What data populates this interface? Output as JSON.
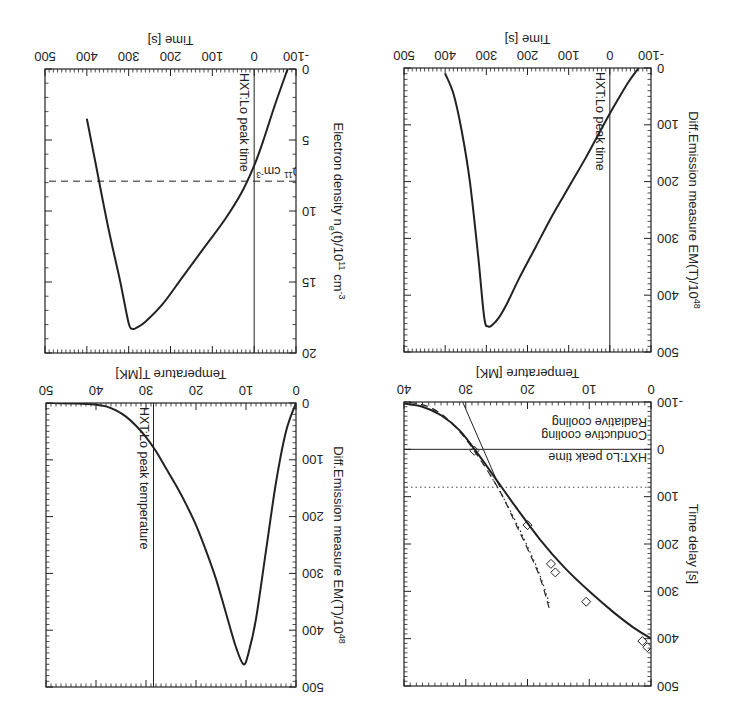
{
  "chart_data": [
    {
      "id": "panel-temperature-vs-delay",
      "type": "line",
      "position": "top-left",
      "box": [
        80,
        36,
        327,
        320
      ],
      "xlabel": "Temperature [MK]",
      "ylabel": "Time delay [s]",
      "xlim": [
        0,
        40
      ],
      "ylim": [
        -100,
        500
      ],
      "x_ticks": [
        0,
        10,
        20,
        30,
        40
      ],
      "y_ticks": [
        -100,
        0,
        100,
        200,
        300,
        400,
        500
      ],
      "hline": {
        "y": 0,
        "label": "HXT:Lo peak time"
      },
      "legend": [
        {
          "label": "Conductive cooling",
          "style": "dashed"
        },
        {
          "label": "Radiative cooling",
          "style": "dotted"
        }
      ],
      "legend_dotted_hline_y": 80,
      "series": [
        {
          "name": "Fit",
          "style": "solid-thick",
          "x": [
            0,
            3,
            6,
            10,
            14,
            18,
            22,
            25,
            28,
            31,
            34,
            37,
            40
          ],
          "y": [
            400,
            375,
            345,
            300,
            250,
            190,
            120,
            65,
            10,
            -40,
            -72,
            -90,
            -97
          ]
        },
        {
          "name": "Linear fit",
          "style": "solid-thin",
          "x": [
            24.5,
            30.5
          ],
          "y": [
            80,
            -100
          ]
        },
        {
          "name": "Conductive cooling",
          "style": "dashed",
          "x": [
            16.5,
            18,
            20,
            22,
            24,
            26,
            28,
            30,
            32,
            34,
            36,
            38,
            40
          ],
          "y": [
            335,
            270,
            210,
            155,
            100,
            55,
            15,
            -22,
            -52,
            -75,
            -90,
            -97,
            -100
          ]
        },
        {
          "name": "Radiative cooling",
          "style": "dotted",
          "x": [
            16.5,
            18,
            20,
            22,
            24,
            26
          ],
          "y": [
            325,
            265,
            205,
            150,
            100,
            55
          ]
        },
        {
          "name": "Observed",
          "style": "diamond",
          "x": [
            0.6,
            1.4,
            10.5,
            15.5,
            16.2,
            20,
            28.6
          ],
          "y": [
            418,
            405,
            322,
            260,
            242,
            160,
            3
          ]
        }
      ]
    },
    {
      "id": "panel-dem-vs-temperature",
      "type": "line",
      "position": "top-right",
      "box": [
        435,
        35,
        685,
        319
      ],
      "xlabel": "Temperature T[MK]",
      "ylabel": "Diff.Emission measure EM(T)/10^48",
      "xlim": [
        0,
        50
      ],
      "ylim": [
        0,
        500
      ],
      "x_ticks": [
        0,
        10,
        20,
        30,
        40,
        50
      ],
      "y_ticks": [
        0,
        100,
        200,
        300,
        400,
        500
      ],
      "vline": {
        "x": 28.5,
        "label": "HXT:Lo peak temperature"
      },
      "series": [
        {
          "name": "DEM",
          "style": "solid-thick",
          "x": [
            0,
            2,
            4,
            6,
            8,
            9.5,
            10.5,
            12,
            14,
            16,
            18,
            20,
            22,
            24,
            26,
            28,
            30,
            32,
            34,
            36,
            38,
            40,
            44,
            50
          ],
          "y": [
            0,
            50,
            140,
            260,
            380,
            440,
            460,
            430,
            370,
            310,
            260,
            215,
            178,
            145,
            115,
            85,
            60,
            40,
            24,
            13,
            6,
            3,
            1,
            0
          ]
        }
      ]
    },
    {
      "id": "panel-dem-vs-time",
      "type": "line",
      "position": "bottom-left",
      "box": [
        80,
        370,
        327,
        654
      ],
      "xlabel": "Time [s]",
      "ylabel": "Diff.Emission measure EM(T)/10^48",
      "xlim": [
        -100,
        500
      ],
      "ylim": [
        0,
        500
      ],
      "x_ticks": [
        -100,
        0,
        100,
        200,
        300,
        400,
        500
      ],
      "y_ticks": [
        0,
        100,
        200,
        300,
        400,
        500
      ],
      "vline": {
        "x": 0,
        "label": "HXT:Lo peak time"
      },
      "series": [
        {
          "name": "DEM",
          "style": "solid-thick",
          "x": [
            -70,
            -45,
            -20,
            0,
            30,
            60,
            100,
            140,
            180,
            220,
            250,
            270,
            285,
            295,
            305,
            320,
            340,
            360,
            380,
            400
          ],
          "y": [
            0,
            25,
            55,
            80,
            120,
            160,
            210,
            260,
            315,
            370,
            415,
            440,
            452,
            455,
            440,
            330,
            200,
            110,
            45,
            10
          ]
        }
      ]
    },
    {
      "id": "panel-density-vs-time",
      "type": "line",
      "position": "bottom-right",
      "box": [
        435,
        369,
        686,
        653
      ],
      "xlabel": "Time [s]",
      "ylabel": "Electron density n_e(t)/10^11 cm^-3",
      "xlim": [
        -100,
        500
      ],
      "ylim": [
        0,
        20
      ],
      "x_ticks": [
        -100,
        0,
        100,
        200,
        300,
        400,
        500
      ],
      "y_ticks": [
        0,
        5,
        10,
        15,
        20
      ],
      "vline": {
        "x": 0,
        "label": "HXT:Lo peak time"
      },
      "hline_dashed": {
        "y": 7.9,
        "label": "Ave.density n_e^rad=7.9*10^11 cm^-3"
      },
      "series": [
        {
          "name": "Density",
          "style": "solid-thick",
          "x": [
            -80,
            -50,
            -20,
            0,
            30,
            70,
            120,
            170,
            220,
            260,
            280,
            290,
            300,
            320,
            350,
            380,
            400
          ],
          "y": [
            0,
            2.5,
            5.2,
            6.8,
            8.7,
            10.6,
            12.6,
            14.6,
            16.6,
            17.8,
            18.2,
            18.3,
            17.9,
            15.0,
            11.0,
            6.5,
            3.5
          ]
        }
      ]
    }
  ]
}
